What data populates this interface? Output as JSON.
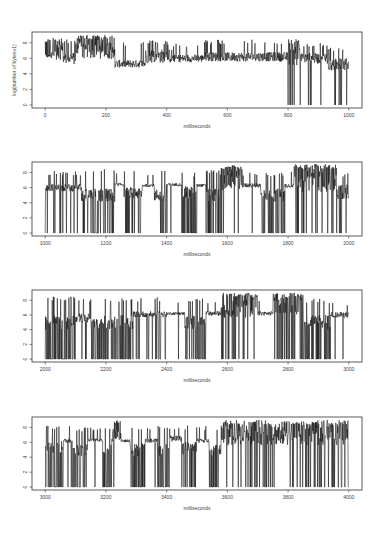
{
  "chart_data": [
    {
      "type": "line",
      "title": "",
      "xlabel": "milliseconds",
      "ylabel": "log(number of bytes+1)",
      "xlim": [
        0,
        1000
      ],
      "ylim": [
        0,
        9
      ],
      "xticks": [
        0,
        200,
        400,
        600,
        800,
        1000
      ],
      "yticks": [
        0,
        2,
        4,
        6,
        8
      ],
      "grid": false,
      "series": [
        {
          "name": "traffic",
          "description": "noisy 6-9 band for 0-230ms, ~5.5 plateau 230-330, ~6.2 with spikes to 8 thereafter; drops to 0 near 830-1000",
          "segments": [
            {
              "from": 0,
              "to": 20,
              "base": 6.3,
              "noise": 0.2,
              "spike_p": 0.4,
              "spike_hi": 8.6,
              "drop_p": 0
            },
            {
              "from": 20,
              "to": 60,
              "base": 7.0,
              "noise": 1.2,
              "spike_p": 0.3,
              "spike_hi": 8.7,
              "drop_p": 0
            },
            {
              "from": 60,
              "to": 100,
              "base": 6.0,
              "noise": 0.8,
              "spike_p": 0.2,
              "spike_hi": 8.5,
              "drop_p": 0
            },
            {
              "from": 100,
              "to": 230,
              "base": 7.2,
              "noise": 1.3,
              "spike_p": 0.35,
              "spike_hi": 9.0,
              "drop_p": 0
            },
            {
              "from": 230,
              "to": 330,
              "base": 5.3,
              "noise": 0.5,
              "spike_p": 0.05,
              "spike_hi": 8.2,
              "drop_p": 0
            },
            {
              "from": 330,
              "to": 420,
              "base": 6.3,
              "noise": 0.9,
              "spike_p": 0.15,
              "spike_hi": 8.3,
              "drop_p": 0
            },
            {
              "from": 420,
              "to": 520,
              "base": 6.0,
              "noise": 0.5,
              "spike_p": 0.05,
              "spike_hi": 8.0,
              "drop_p": 0
            },
            {
              "from": 520,
              "to": 800,
              "base": 6.2,
              "noise": 0.6,
              "spike_p": 0.08,
              "spike_hi": 8.4,
              "drop_p": 0
            },
            {
              "from": 800,
              "to": 840,
              "base": 6.5,
              "noise": 1.4,
              "spike_p": 0.2,
              "spike_hi": 8.5,
              "drop_p": 0.1
            },
            {
              "from": 840,
              "to": 930,
              "base": 6.0,
              "noise": 0.7,
              "spike_p": 0.08,
              "spike_hi": 8.0,
              "drop_p": 0.07
            },
            {
              "from": 930,
              "to": 1000,
              "base": 5.2,
              "noise": 0.8,
              "spike_p": 0.06,
              "spike_hi": 7.5,
              "drop_p": 0.08
            }
          ]
        }
      ]
    },
    {
      "type": "line",
      "title": "",
      "xlabel": "milliseconds",
      "ylabel": "",
      "xlim": [
        1000,
        2000
      ],
      "ylim": [
        0,
        9
      ],
      "xticks": [
        1000,
        1200,
        1400,
        1600,
        1800,
        2000
      ],
      "yticks": [
        0,
        2,
        4,
        6,
        8
      ],
      "grid": false,
      "series": [
        {
          "name": "traffic",
          "description": "plateaus ~6.3 interrupted by dense bursts dropping to 0; dense 6-9 bursts around 1580-1650 and 1800-1950",
          "segments": [
            {
              "from": 1000,
              "to": 1120,
              "base": 6.0,
              "noise": 0.5,
              "spike_p": 0.08,
              "spike_hi": 8.2,
              "drop_p": 0.1
            },
            {
              "from": 1120,
              "to": 1230,
              "base": 5.0,
              "noise": 0.9,
              "spike_p": 0.06,
              "spike_hi": 8.5,
              "drop_p": 0.35
            },
            {
              "from": 1230,
              "to": 1260,
              "base": 6.4,
              "noise": 0.2,
              "spike_p": 0.05,
              "spike_hi": 8.3,
              "drop_p": 0
            },
            {
              "from": 1260,
              "to": 1320,
              "base": 5.3,
              "noise": 0.8,
              "spike_p": 0.08,
              "spike_hi": 8.3,
              "drop_p": 0.25
            },
            {
              "from": 1320,
              "to": 1360,
              "base": 6.3,
              "noise": 0.2,
              "spike_p": 0.04,
              "spike_hi": 8.0,
              "drop_p": 0
            },
            {
              "from": 1360,
              "to": 1400,
              "base": 5.0,
              "noise": 0.8,
              "spike_p": 0.08,
              "spike_hi": 8.3,
              "drop_p": 0.3
            },
            {
              "from": 1400,
              "to": 1450,
              "base": 6.4,
              "noise": 0.2,
              "spike_p": 0.04,
              "spike_hi": 8.0,
              "drop_p": 0.02
            },
            {
              "from": 1450,
              "to": 1500,
              "base": 5.3,
              "noise": 0.9,
              "spike_p": 0.08,
              "spike_hi": 8.0,
              "drop_p": 0.3
            },
            {
              "from": 1500,
              "to": 1530,
              "base": 6.3,
              "noise": 0.2,
              "spike_p": 0.05,
              "spike_hi": 8.0,
              "drop_p": 0
            },
            {
              "from": 1530,
              "to": 1580,
              "base": 5.0,
              "noise": 0.9,
              "spike_p": 0.1,
              "spike_hi": 8.3,
              "drop_p": 0.3
            },
            {
              "from": 1580,
              "to": 1650,
              "base": 7.2,
              "noise": 1.6,
              "spike_p": 0.3,
              "spike_hi": 9.0,
              "drop_p": 0.05
            },
            {
              "from": 1650,
              "to": 1710,
              "base": 6.3,
              "noise": 0.3,
              "spike_p": 0.05,
              "spike_hi": 8.0,
              "drop_p": 0.05
            },
            {
              "from": 1710,
              "to": 1790,
              "base": 5.0,
              "noise": 0.9,
              "spike_p": 0.1,
              "spike_hi": 8.0,
              "drop_p": 0.3
            },
            {
              "from": 1790,
              "to": 1820,
              "base": 6.3,
              "noise": 0.3,
              "spike_p": 0.08,
              "spike_hi": 8.3,
              "drop_p": 0.05
            },
            {
              "from": 1820,
              "to": 1960,
              "base": 7.0,
              "noise": 1.6,
              "spike_p": 0.3,
              "spike_hi": 9.1,
              "drop_p": 0.12
            },
            {
              "from": 1960,
              "to": 2000,
              "base": 5.5,
              "noise": 1.0,
              "spike_p": 0.1,
              "spike_hi": 8.0,
              "drop_p": 0.2
            }
          ]
        }
      ]
    },
    {
      "type": "line",
      "title": "",
      "xlabel": "milliseconds",
      "ylabel": "",
      "xlim": [
        2000,
        3000
      ],
      "ylim": [
        0,
        9
      ],
      "xticks": [
        2000,
        2200,
        2400,
        2600,
        2800,
        3000
      ],
      "yticks": [
        0,
        2,
        4,
        6,
        8
      ],
      "grid": false,
      "series": [
        {
          "name": "traffic",
          "description": "very dense 0-8 oscillation 2000-2300, then plateaus ~6.2 with drop bursts; dense 6-9 bursts around 2630-2700 and 2780-2850",
          "segments": [
            {
              "from": 2000,
              "to": 2100,
              "base": 5.0,
              "noise": 1.0,
              "spike_p": 0.12,
              "spike_hi": 8.5,
              "drop_p": 0.45
            },
            {
              "from": 2100,
              "to": 2150,
              "base": 5.6,
              "noise": 0.6,
              "spike_p": 0.08,
              "spike_hi": 8.3,
              "drop_p": 0.2
            },
            {
              "from": 2150,
              "to": 2290,
              "base": 5.0,
              "noise": 1.0,
              "spike_p": 0.12,
              "spike_hi": 8.4,
              "drop_p": 0.45
            },
            {
              "from": 2290,
              "to": 2400,
              "base": 6.1,
              "noise": 0.4,
              "spike_p": 0.06,
              "spike_hi": 8.4,
              "drop_p": 0.12
            },
            {
              "from": 2400,
              "to": 2460,
              "base": 6.2,
              "noise": 0.2,
              "spike_p": 0.03,
              "spike_hi": 8.0,
              "drop_p": 0.01
            },
            {
              "from": 2460,
              "to": 2530,
              "base": 5.0,
              "noise": 0.9,
              "spike_p": 0.1,
              "spike_hi": 8.3,
              "drop_p": 0.3
            },
            {
              "from": 2530,
              "to": 2580,
              "base": 6.2,
              "noise": 0.3,
              "spike_p": 0.04,
              "spike_hi": 8.0,
              "drop_p": 0.03
            },
            {
              "from": 2580,
              "to": 2700,
              "base": 7.2,
              "noise": 1.6,
              "spike_p": 0.3,
              "spike_hi": 9.0,
              "drop_p": 0.15
            },
            {
              "from": 2700,
              "to": 2750,
              "base": 6.2,
              "noise": 0.3,
              "spike_p": 0.05,
              "spike_hi": 8.0,
              "drop_p": 0.05
            },
            {
              "from": 2750,
              "to": 2850,
              "base": 7.3,
              "noise": 1.3,
              "spike_p": 0.3,
              "spike_hi": 9.0,
              "drop_p": 0.1
            },
            {
              "from": 2850,
              "to": 2940,
              "base": 5.0,
              "noise": 1.0,
              "spike_p": 0.1,
              "spike_hi": 8.2,
              "drop_p": 0.3
            },
            {
              "from": 2940,
              "to": 3000,
              "base": 6.0,
              "noise": 0.4,
              "spike_p": 0.06,
              "spike_hi": 7.8,
              "drop_p": 0.06
            }
          ]
        }
      ]
    },
    {
      "type": "line",
      "title": "",
      "xlabel": "milliseconds",
      "ylabel": "",
      "xlim": [
        3000,
        4000
      ],
      "ylim": [
        0,
        9
      ],
      "xticks": [
        3000,
        3200,
        3400,
        3600,
        3800,
        4000
      ],
      "yticks": [
        0,
        2,
        4,
        6,
        8
      ],
      "grid": false,
      "series": [
        {
          "name": "traffic",
          "description": "plateaus ~6.2 with periodic drop bursts to 0 up to ~3580ms; afterward dense noisy 4-9 band with frequent drops to 0",
          "segments": [
            {
              "from": 3000,
              "to": 3060,
              "base": 5.3,
              "noise": 0.9,
              "spike_p": 0.1,
              "spike_hi": 8.3,
              "drop_p": 0.35
            },
            {
              "from": 3060,
              "to": 3090,
              "base": 6.2,
              "noise": 0.3,
              "spike_p": 0.06,
              "spike_hi": 8.2,
              "drop_p": 0.05
            },
            {
              "from": 3090,
              "to": 3140,
              "base": 5.0,
              "noise": 0.9,
              "spike_p": 0.1,
              "spike_hi": 8.0,
              "drop_p": 0.3
            },
            {
              "from": 3140,
              "to": 3190,
              "base": 6.3,
              "noise": 0.2,
              "spike_p": 0.05,
              "spike_hi": 8.0,
              "drop_p": 0.01
            },
            {
              "from": 3190,
              "to": 3220,
              "base": 5.0,
              "noise": 0.9,
              "spike_p": 0.1,
              "spike_hi": 8.0,
              "drop_p": 0.35
            },
            {
              "from": 3220,
              "to": 3250,
              "base": 7.0,
              "noise": 1.2,
              "spike_p": 0.2,
              "spike_hi": 9.0,
              "drop_p": 0.02
            },
            {
              "from": 3250,
              "to": 3280,
              "base": 6.2,
              "noise": 0.2,
              "spike_p": 0.04,
              "spike_hi": 8.0,
              "drop_p": 0.01
            },
            {
              "from": 3280,
              "to": 3330,
              "base": 5.0,
              "noise": 0.9,
              "spike_p": 0.1,
              "spike_hi": 8.3,
              "drop_p": 0.3
            },
            {
              "from": 3330,
              "to": 3370,
              "base": 6.2,
              "noise": 0.3,
              "spike_p": 0.05,
              "spike_hi": 8.0,
              "drop_p": 0.02
            },
            {
              "from": 3370,
              "to": 3410,
              "base": 5.0,
              "noise": 0.9,
              "spike_p": 0.1,
              "spike_hi": 8.3,
              "drop_p": 0.3
            },
            {
              "from": 3410,
              "to": 3450,
              "base": 6.5,
              "noise": 0.4,
              "spike_p": 0.1,
              "spike_hi": 8.3,
              "drop_p": 0.02
            },
            {
              "from": 3450,
              "to": 3500,
              "base": 5.2,
              "noise": 0.9,
              "spike_p": 0.1,
              "spike_hi": 8.3,
              "drop_p": 0.3
            },
            {
              "from": 3500,
              "to": 3540,
              "base": 6.2,
              "noise": 0.3,
              "spike_p": 0.08,
              "spike_hi": 8.2,
              "drop_p": 0.02
            },
            {
              "from": 3540,
              "to": 3580,
              "base": 5.0,
              "noise": 0.9,
              "spike_p": 0.1,
              "spike_hi": 8.0,
              "drop_p": 0.3
            },
            {
              "from": 3580,
              "to": 4000,
              "base": 7.2,
              "noise": 1.6,
              "spike_p": 0.15,
              "spike_hi": 9.0,
              "drop_p": 0.13
            }
          ]
        }
      ]
    }
  ],
  "layout": {
    "panels": [
      {
        "top": 32,
        "bottom": 108,
        "show_ylabel": true
      },
      {
        "top": 162,
        "bottom": 236,
        "show_ylabel": false
      },
      {
        "top": 290,
        "bottom": 362,
        "show_ylabel": false
      },
      {
        "top": 417,
        "bottom": 490,
        "show_ylabel": false
      }
    ],
    "frame_left": 32,
    "frame_right": 362,
    "line_color": "#111111",
    "frame_color": "#333333"
  }
}
